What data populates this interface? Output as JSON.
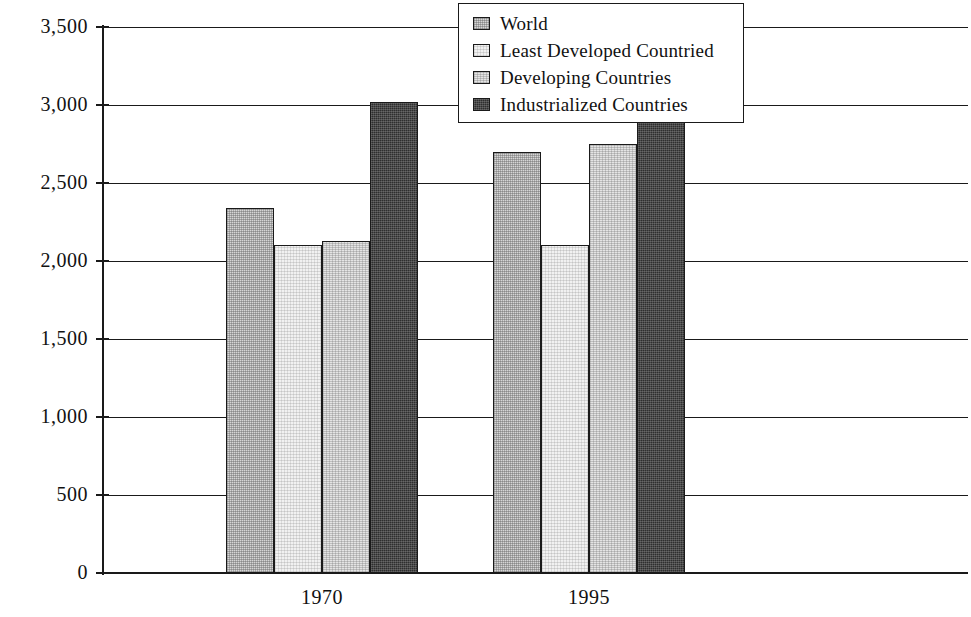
{
  "chart_data": {
    "type": "bar",
    "title": "",
    "subtitle": "",
    "xlabel": "",
    "ylabel": "",
    "categories": [
      "1970",
      "1995"
    ],
    "series": [
      {
        "name": "World",
        "values": [
          2340,
          2700
        ],
        "swatch": "#d6d6d6"
      },
      {
        "name": "Least Developed Countried",
        "values": [
          2100,
          2100
        ],
        "swatch": "#f1f1f1"
      },
      {
        "name": "Developing Countries",
        "values": [
          2130,
          2750
        ],
        "swatch": "#e4e4e4"
      },
      {
        "name": "Industrialized Countries",
        "values": [
          3020,
          3150
        ],
        "swatch": "#2e2e2e"
      }
    ],
    "ylim": [
      0,
      3500
    ],
    "ytick_values": [
      0,
      500,
      1000,
      1500,
      2000,
      2500,
      3000,
      3500
    ],
    "ytick_labels": [
      "0",
      "500",
      "1,000",
      "1,500",
      "2,000",
      "2,500",
      "3,000",
      "3,500"
    ],
    "grid": true,
    "grid_axis": "y",
    "legend_position": "top-center",
    "legend_entries": [
      "World",
      "Least Developed Countried",
      "Developing Countries",
      "Industrialized Countries"
    ]
  },
  "axes": {
    "x_tick_labels": [
      "1970",
      "1995"
    ]
  },
  "colors": {
    "axis": "#1a1a1a",
    "grid": "#1a1a1a",
    "background": "#ffffff",
    "text": "#111111"
  }
}
